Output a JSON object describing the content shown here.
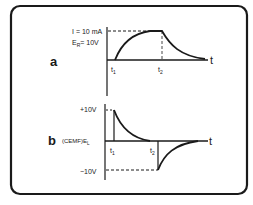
{
  "figure": {
    "panel_a": {
      "label": "a",
      "current_label": "I = 10 mA",
      "voltage_label_main": "E",
      "voltage_label_sub": "R",
      "voltage_label_value": "= 10V",
      "t1": "t",
      "t1_sub": "1",
      "t2": "t",
      "t2_sub": "2",
      "time_axis": "t",
      "curve": "rise from t1 to plateau, exponential decay after t2"
    },
    "panel_b": {
      "label": "b",
      "y_label": "(CEMF)E",
      "y_label_sub": "L",
      "pos_level": "+10V",
      "neg_level": "−10V",
      "t1": "t",
      "t1_sub": "1",
      "t2": "t",
      "t2_sub": "2",
      "time_axis": "t",
      "curve": "spike +10V at t1 decaying to 0; spike -10V at t2 decaying to 0"
    },
    "colors": {
      "ink": "#1a1a1a",
      "background": "#ffffff"
    }
  }
}
